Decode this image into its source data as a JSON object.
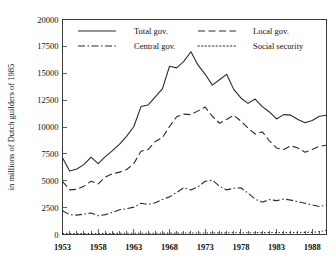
{
  "chart_data": {
    "type": "line",
    "title": "",
    "xlabel": "",
    "ylabel": "in millions of Dutch guilders of 1985",
    "xlim": [
      1953,
      1990
    ],
    "ylim": [
      0,
      20000
    ],
    "grid": false,
    "legend_position": "top-inside",
    "x_tick_labels": [
      "1953",
      "1958",
      "1963",
      "1968",
      "1973",
      "1978",
      "1983",
      "1988"
    ],
    "x_tick_values": [
      1953,
      1958,
      1963,
      1968,
      1973,
      1978,
      1983,
      1988
    ],
    "x_minor_ticks_every": 1,
    "y_tick_labels": [
      "0",
      "2500",
      "5000",
      "7500",
      "10000",
      "12500",
      "15000",
      "17500",
      "20000"
    ],
    "y_tick_values": [
      0,
      2500,
      5000,
      7500,
      10000,
      12500,
      15000,
      17500,
      20000
    ],
    "x": [
      1953,
      1954,
      1955,
      1956,
      1957,
      1958,
      1959,
      1960,
      1961,
      1962,
      1963,
      1964,
      1965,
      1966,
      1967,
      1968,
      1969,
      1970,
      1971,
      1972,
      1973,
      1974,
      1975,
      1976,
      1977,
      1978,
      1979,
      1980,
      1981,
      1982,
      1983,
      1984,
      1985,
      1986,
      1987,
      1988,
      1989,
      1990
    ],
    "series": [
      {
        "name": "Total gov.",
        "dash": "solid",
        "values": [
          7150,
          5900,
          6100,
          6500,
          7200,
          6600,
          7250,
          7800,
          8400,
          9150,
          10050,
          11900,
          12050,
          12800,
          13550,
          15650,
          15500,
          16100,
          17000,
          15750,
          14900,
          13900,
          14400,
          14900,
          13500,
          12700,
          12200,
          12600,
          11900,
          11400,
          10750,
          11150,
          11100,
          10700,
          10400,
          10600,
          11000,
          11100
        ]
      },
      {
        "name": "Local gov.",
        "dash": "dashed",
        "values": [
          4950,
          4150,
          4200,
          4500,
          4950,
          4700,
          5350,
          5650,
          5800,
          6050,
          6600,
          7750,
          7900,
          8650,
          9000,
          10050,
          10950,
          11200,
          11150,
          11500,
          11850,
          11000,
          10350,
          10700,
          11100,
          10550,
          9900,
          9350,
          9550,
          8700,
          8050,
          7900,
          8250,
          8050,
          7650,
          7900,
          8200,
          8300
        ]
      },
      {
        "name": "Central gov.",
        "dash": "dashdot",
        "values": [
          2200,
          1850,
          1800,
          1900,
          2000,
          1750,
          1850,
          2050,
          2300,
          2400,
          2550,
          2900,
          2800,
          2950,
          3250,
          3500,
          3900,
          4350,
          4150,
          4450,
          4950,
          5050,
          4500,
          4150,
          4300,
          4350,
          3850,
          3300,
          3000,
          3250,
          3150,
          3300,
          3200,
          3050,
          2900,
          2750,
          2600,
          2750
        ]
      },
      {
        "name": "Social security",
        "dash": "dotted",
        "values": [
          80,
          80,
          80,
          90,
          90,
          95,
          100,
          100,
          110,
          110,
          110,
          120,
          120,
          120,
          125,
          130,
          130,
          135,
          140,
          140,
          145,
          150,
          150,
          155,
          160,
          160,
          165,
          170,
          175,
          180,
          185,
          190,
          190,
          190,
          195,
          200,
          260,
          380
        ]
      }
    ]
  }
}
